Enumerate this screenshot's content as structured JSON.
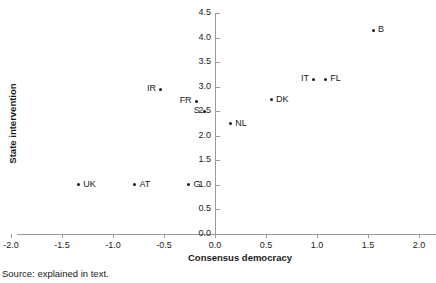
{
  "figure": {
    "title": "",
    "source_note": "Source: explained in text."
  },
  "chart_data": {
    "type": "scatter",
    "title": "",
    "xlabel": "Consensus democracy",
    "ylabel": "State intervention",
    "xlim": [
      -2.0,
      2.0
    ],
    "ylim": [
      0.0,
      4.5
    ],
    "xticks": [
      "-2.0",
      "-1.5",
      "-1.0",
      "-0.5",
      "0.0",
      "0.5",
      "1.0",
      "1.5",
      "2.0"
    ],
    "xtick_values": [
      -2.0,
      -1.5,
      -1.0,
      -0.5,
      0.0,
      0.5,
      1.0,
      1.5,
      2.0
    ],
    "yticks": [
      "0.0",
      "0.5",
      "1.0",
      "1.5",
      "2.0",
      "2.5",
      "3.0",
      "3.5",
      "4.0",
      "4.5"
    ],
    "ytick_values": [
      0.0,
      0.5,
      1.0,
      1.5,
      2.0,
      2.5,
      3.0,
      3.5,
      4.0,
      4.5
    ],
    "grid": false,
    "legend": "none",
    "marker_color": "#1a1a1a",
    "points": [
      {
        "label": "B",
        "x": 1.55,
        "y": 4.15,
        "label_pos": "right"
      },
      {
        "label": "IT",
        "x": 0.97,
        "y": 3.15,
        "label_pos": "left"
      },
      {
        "label": "FL",
        "x": 1.08,
        "y": 3.15,
        "label_pos": "right"
      },
      {
        "label": "IR",
        "x": -0.53,
        "y": 2.95,
        "label_pos": "left"
      },
      {
        "label": "DK",
        "x": 0.55,
        "y": 2.73,
        "label_pos": "right"
      },
      {
        "label": "FR",
        "x": -0.18,
        "y": 2.7,
        "label_pos": "left"
      },
      {
        "label": "S",
        "x": -0.1,
        "y": 2.5,
        "label_pos": "left"
      },
      {
        "label": "NL",
        "x": 0.15,
        "y": 2.25,
        "label_pos": "right"
      },
      {
        "label": "UK",
        "x": -1.34,
        "y": 1.0,
        "label_pos": "right"
      },
      {
        "label": "AT",
        "x": -0.79,
        "y": 1.0,
        "label_pos": "right"
      },
      {
        "label": "G",
        "x": -0.26,
        "y": 1.0,
        "label_pos": "right"
      }
    ]
  }
}
